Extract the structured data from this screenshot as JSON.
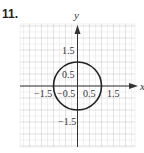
{
  "problem_number": "11.",
  "chart_data": {
    "type": "line",
    "title": "",
    "xlabel": "x",
    "ylabel": "y",
    "xlim": [
      -2.4,
      2.4
    ],
    "ylim": [
      -2.55,
      2.6
    ],
    "grid": true,
    "grid_minor_step": 0.25,
    "grid_major_step": 1,
    "x_tick_labels": [
      "-1.5",
      "-0.5",
      "0.5",
      "1.5"
    ],
    "x_ticks": [
      -1.5,
      -0.5,
      0.5,
      1.5
    ],
    "y_tick_labels": [
      "1.5",
      "0.5",
      "-1.5"
    ],
    "y_ticks": [
      1.5,
      0.5,
      -1.5
    ],
    "series": [
      {
        "name": "circle",
        "shape": "circle",
        "center": [
          0,
          0
        ],
        "radius": 1,
        "equation": "x^2 + y^2 = 1"
      }
    ]
  },
  "labels": {
    "x_axis": "x",
    "y_axis": "y",
    "xt0": "−1.5",
    "xt1": "−0.5",
    "xt2": "0.5",
    "xt3": "1.5",
    "yt0": "1.5",
    "yt1": "0.5",
    "yt2": "−1.5"
  },
  "colors": {
    "grid_minor": "#e6e6e6",
    "grid_major": "#cfcfcf",
    "axis": "#333333",
    "curve": "#222222"
  }
}
